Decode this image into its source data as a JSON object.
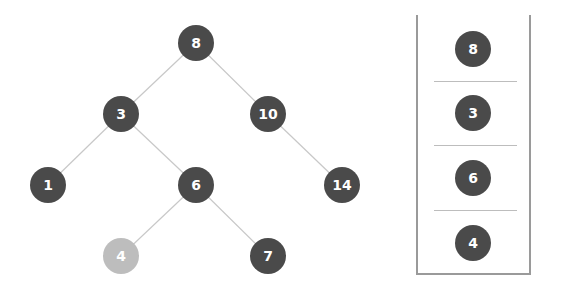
{
  "tree": {
    "nodes": [
      {
        "id": "n8",
        "label": "8",
        "x": 196,
        "y": 43,
        "highlight": false
      },
      {
        "id": "n3",
        "label": "3",
        "x": 121,
        "y": 114,
        "highlight": false
      },
      {
        "id": "n10",
        "label": "10",
        "x": 268,
        "y": 114,
        "highlight": false
      },
      {
        "id": "n1",
        "label": "1",
        "x": 48,
        "y": 185,
        "highlight": false
      },
      {
        "id": "n6",
        "label": "6",
        "x": 196,
        "y": 185,
        "highlight": false
      },
      {
        "id": "n14",
        "label": "14",
        "x": 342,
        "y": 185,
        "highlight": false
      },
      {
        "id": "n4",
        "label": "4",
        "x": 121,
        "y": 256,
        "highlight": true
      },
      {
        "id": "n7",
        "label": "7",
        "x": 268,
        "y": 256,
        "highlight": false
      }
    ],
    "edges": [
      [
        "n8",
        "n3"
      ],
      [
        "n8",
        "n10"
      ],
      [
        "n3",
        "n1"
      ],
      [
        "n3",
        "n6"
      ],
      [
        "n10",
        "n14"
      ],
      [
        "n6",
        "n4"
      ],
      [
        "n6",
        "n7"
      ]
    ],
    "colors": {
      "node": "#4a4a4a",
      "highlight": "#bdbdbd",
      "edge": "#c8c8c8",
      "text": "#ffffff"
    }
  },
  "stack": {
    "items": [
      "8",
      "3",
      "6",
      "4"
    ]
  }
}
